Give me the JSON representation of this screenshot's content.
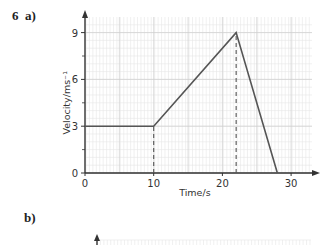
{
  "question": {
    "number": "6",
    "part_a": "a)",
    "part_b": "b)"
  },
  "chart_data": {
    "type": "line",
    "title": "",
    "xlabel": "Time/s",
    "ylabel": "Velocity/ms⁻¹",
    "xlim": [
      0,
      33
    ],
    "ylim": [
      0,
      10
    ],
    "x_ticks": [
      0,
      10,
      20,
      30
    ],
    "y_ticks": [
      0,
      3,
      6,
      9
    ],
    "grid": true,
    "series": [
      {
        "name": "velocity",
        "x": [
          0,
          10,
          22,
          28
        ],
        "y": [
          3,
          3,
          9,
          0
        ]
      }
    ],
    "annotations": [
      {
        "type": "dashed-vertical",
        "x": 10,
        "from_y": 0,
        "to_y": 3
      },
      {
        "type": "dashed-vertical",
        "x": 22,
        "from_y": 0,
        "to_y": 9
      }
    ]
  },
  "colors": {
    "grid_minor": "#e6e6e6",
    "grid_major": "#cfcfcf",
    "line": "#555555",
    "axis": "#333333"
  }
}
